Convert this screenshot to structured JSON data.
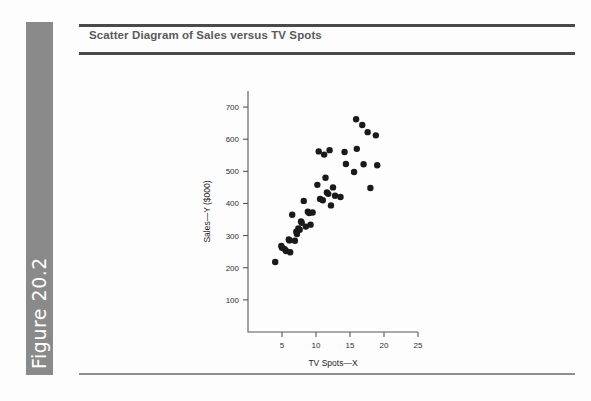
{
  "figure": {
    "label": "Figure 20.2",
    "bar_color": "#8a8a8a"
  },
  "header": {
    "title": "Scatter Diagram of Sales versus TV Spots",
    "rule_color": "#4a4a4a",
    "title_color": "#5a5a5a"
  },
  "chart_data": {
    "type": "scatter",
    "title": "Scatter Diagram of Sales versus TV Spots",
    "xlabel": "TV Spots—X",
    "ylabel": "Sales—Y ($000)",
    "xlim": [
      0,
      25
    ],
    "ylim": [
      0,
      750
    ],
    "xticks": [
      5,
      10,
      15,
      20,
      25
    ],
    "yticks": [
      100,
      200,
      300,
      400,
      500,
      600,
      700
    ],
    "xtick_labels": [
      "5",
      "10",
      "15",
      "20",
      "25"
    ],
    "ytick_labels": [
      "100",
      "200",
      "300",
      "400",
      "500",
      "600",
      "700"
    ],
    "grid": false,
    "legend": false,
    "marker": "filled-circle",
    "marker_color": "#1a1a1a",
    "points": [
      {
        "x": 4.0,
        "y": 218
      },
      {
        "x": 4.9,
        "y": 268
      },
      {
        "x": 5.0,
        "y": 262
      },
      {
        "x": 5.4,
        "y": 258
      },
      {
        "x": 5.6,
        "y": 252
      },
      {
        "x": 6.0,
        "y": 288
      },
      {
        "x": 6.1,
        "y": 285
      },
      {
        "x": 6.2,
        "y": 248
      },
      {
        "x": 6.5,
        "y": 365
      },
      {
        "x": 6.9,
        "y": 284
      },
      {
        "x": 7.1,
        "y": 312
      },
      {
        "x": 7.2,
        "y": 305
      },
      {
        "x": 7.4,
        "y": 322
      },
      {
        "x": 7.6,
        "y": 318
      },
      {
        "x": 7.8,
        "y": 344
      },
      {
        "x": 7.9,
        "y": 340
      },
      {
        "x": 8.2,
        "y": 408
      },
      {
        "x": 8.5,
        "y": 328
      },
      {
        "x": 8.8,
        "y": 374
      },
      {
        "x": 9.0,
        "y": 370
      },
      {
        "x": 9.2,
        "y": 334
      },
      {
        "x": 9.5,
        "y": 372
      },
      {
        "x": 10.2,
        "y": 458
      },
      {
        "x": 10.4,
        "y": 562
      },
      {
        "x": 10.6,
        "y": 414
      },
      {
        "x": 11.0,
        "y": 410
      },
      {
        "x": 11.2,
        "y": 552
      },
      {
        "x": 11.4,
        "y": 480
      },
      {
        "x": 11.6,
        "y": 434
      },
      {
        "x": 11.8,
        "y": 430
      },
      {
        "x": 12.0,
        "y": 566
      },
      {
        "x": 12.2,
        "y": 394
      },
      {
        "x": 12.5,
        "y": 450
      },
      {
        "x": 12.8,
        "y": 424
      },
      {
        "x": 13.6,
        "y": 420
      },
      {
        "x": 14.2,
        "y": 560
      },
      {
        "x": 14.4,
        "y": 523
      },
      {
        "x": 15.6,
        "y": 498
      },
      {
        "x": 15.9,
        "y": 662
      },
      {
        "x": 16.0,
        "y": 570
      },
      {
        "x": 16.8,
        "y": 644
      },
      {
        "x": 17.0,
        "y": 522
      },
      {
        "x": 17.6,
        "y": 622
      },
      {
        "x": 18.0,
        "y": 448
      },
      {
        "x": 18.8,
        "y": 612
      },
      {
        "x": 19.0,
        "y": 519
      }
    ]
  }
}
